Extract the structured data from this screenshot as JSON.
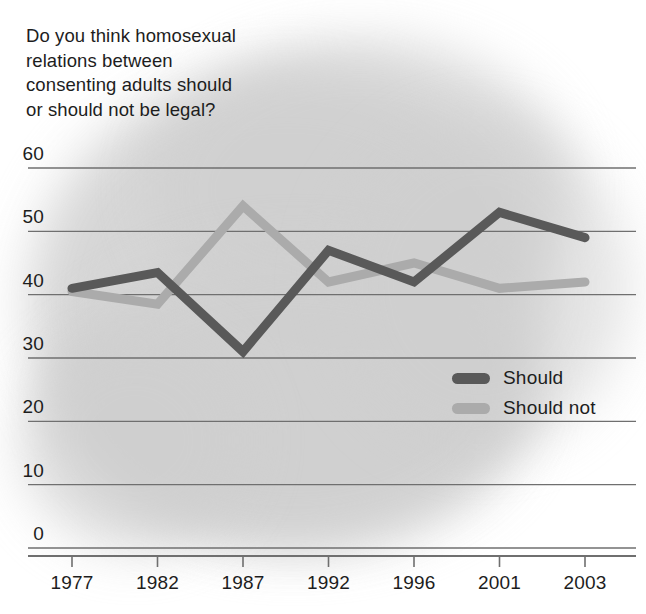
{
  "chart_data": {
    "type": "line",
    "title": "Do you think homosexual\nrelations between\nconsenting adults should\nor should not be legal?",
    "xlabel": "",
    "ylabel": "",
    "x": [
      "1977",
      "1982",
      "1987",
      "1992",
      "1996",
      "2001",
      "2003"
    ],
    "categories": [
      "1977",
      "1982",
      "1987",
      "1992",
      "1996",
      "2001",
      "2003"
    ],
    "ylim": [
      0,
      60
    ],
    "yticks": [
      0,
      10,
      20,
      30,
      40,
      50,
      60
    ],
    "ytick_labels": [
      "0",
      "10",
      "20",
      "30",
      "40",
      "50",
      "60"
    ],
    "grid": true,
    "legend_position": "inside-right",
    "series": [
      {
        "name": "Should",
        "color": "#595959",
        "values": [
          41,
          43.5,
          31,
          47,
          42,
          53,
          49
        ]
      },
      {
        "name": "Should not",
        "color": "#ababab",
        "values": [
          40.5,
          38.5,
          54,
          42,
          45,
          41,
          42
        ]
      }
    ]
  },
  "legend": {
    "items": [
      {
        "label": "Should",
        "color": "#595959"
      },
      {
        "label": "Should not",
        "color": "#ababab"
      }
    ]
  },
  "colors": {
    "should": "#595959",
    "should_not": "#ababab",
    "gridline": "#6f6f6f",
    "text": "#1d1d1d",
    "background_blob": "#cfcfcf"
  }
}
